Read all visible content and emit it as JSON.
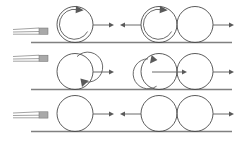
{
  "figure": {
    "type": "diagram",
    "background_color": "#ffffff",
    "ball_stroke_color": "#4a4a4a",
    "ground_color": "#808080",
    "arrow_color": "#5a5a5a",
    "cue_color": "#8c8c8c",
    "cue_tip_color": "#a9a9a9",
    "width": 240,
    "height": 141
  },
  "rows": [
    {
      "id": "row-top",
      "ground_y": 42,
      "ground_x1": 31,
      "ground_x2": 232,
      "cue": {
        "x_start": 13,
        "x_end": 47,
        "y": 31,
        "tip_width": 8,
        "tip_height": 6
      },
      "left_ball": {
        "cx": 75,
        "cy": 24,
        "r": 18,
        "spin": "clockwise",
        "spin_label": "topspin"
      },
      "left_arrow": {
        "x1": 93,
        "x2": 113,
        "y": 25,
        "direction": "right"
      },
      "mid_arrow": {
        "x1": 141,
        "x2": 121,
        "y": 25,
        "direction": "left"
      },
      "right_ball_a": {
        "cx": 159,
        "cy": 24,
        "r": 18,
        "spin": "clockwise",
        "spin_label": "topspin"
      },
      "right_ball_b": {
        "cx": 195,
        "cy": 24,
        "r": 18,
        "spin": "none",
        "spin_label": "no spin"
      },
      "right_arrow": {
        "x1": 213,
        "x2": 233,
        "y": 25,
        "direction": "right"
      }
    },
    {
      "id": "row-middle",
      "ground_y": 89,
      "ground_x1": 31,
      "ground_x2": 232,
      "cue": {
        "x_start": 13,
        "x_end": 47,
        "y": 58,
        "tip_width": 8,
        "tip_height": 6
      },
      "left_ball": {
        "cx": 75,
        "cy": 71,
        "r": 18,
        "spin": "counterclockwise",
        "spin_label": "backspin"
      },
      "left_arrow": {
        "x1": 93,
        "x2": 113,
        "y": 72,
        "direction": "right"
      },
      "right_ball_a": {
        "cx": 159,
        "cy": 71,
        "r": 18,
        "spin": "counterclockwise",
        "spin_label": "backspin"
      },
      "inner_arrow": {
        "x1": 152,
        "x2": 186,
        "y": 72,
        "direction": "right"
      },
      "right_ball_b": {
        "cx": 195,
        "cy": 71,
        "r": 18,
        "spin": "none",
        "spin_label": "no spin"
      },
      "right_arrow": {
        "x1": 213,
        "x2": 233,
        "y": 72,
        "direction": "right"
      }
    },
    {
      "id": "row-bottom",
      "ground_y": 131,
      "ground_x1": 31,
      "ground_x2": 232,
      "cue": {
        "x_start": 13,
        "x_end": 47,
        "y": 115,
        "tip_width": 8,
        "tip_height": 6
      },
      "left_ball": {
        "cx": 75,
        "cy": 113,
        "r": 18,
        "spin": "none",
        "spin_label": "no spin"
      },
      "left_arrow": {
        "x1": 93,
        "x2": 113,
        "y": 114,
        "direction": "right"
      },
      "mid_arrow": {
        "x1": 141,
        "x2": 121,
        "y": 114,
        "direction": "left"
      },
      "right_ball_a": {
        "cx": 159,
        "cy": 113,
        "r": 18,
        "spin": "none",
        "spin_label": "no spin"
      },
      "right_ball_b": {
        "cx": 195,
        "cy": 113,
        "r": 18,
        "spin": "none",
        "spin_label": "no spin"
      },
      "right_arrow": {
        "x1": 213,
        "x2": 233,
        "y": 114,
        "direction": "right"
      }
    }
  ],
  "labels": {
    "cue_stick": "cue stick",
    "cue_tip": "cue tip",
    "ball": "billiard ball",
    "ground": "table surface line",
    "velocity_arrow": "velocity arrow",
    "spin_arrow": "spin direction arrow"
  }
}
